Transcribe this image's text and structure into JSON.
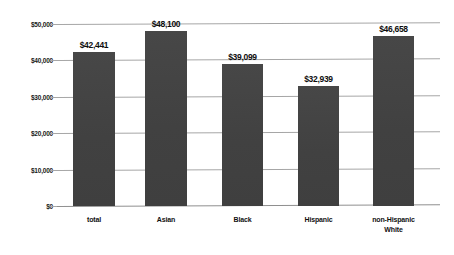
{
  "chart_data": {
    "type": "bar",
    "title": "",
    "subtitle": "",
    "xlabel": "",
    "ylabel": "",
    "categories": [
      "total",
      "Asian",
      "Black",
      "Hispanic",
      "non-Hispanic\nWhite"
    ],
    "values": [
      42441,
      48100,
      39099,
      32939,
      46658
    ],
    "data_labels": [
      "$42,441",
      "$48,100",
      "$39,099",
      "$32,939",
      "$46,658"
    ],
    "ylim": [
      0,
      50000
    ],
    "ytick_values": [
      0,
      10000,
      20000,
      30000,
      40000,
      50000
    ],
    "ytick_labels": [
      "$0",
      "$10,000",
      "$20,000",
      "$30,000",
      "$40,000",
      "$50,000"
    ],
    "grid": true,
    "grid_axis": "y",
    "legend": false,
    "legend_position": "none",
    "series": [
      {
        "name": "",
        "values": [
          42441,
          48100,
          39099,
          32939,
          46658
        ]
      }
    ]
  },
  "style": {
    "bar_color": "#444444",
    "grid_color": "#a6a6a6",
    "text_color": "#111111",
    "background": "#ffffff"
  },
  "axis": {
    "y_labels": [
      {
        "text": "$50,000",
        "value": 50000
      },
      {
        "text": "$40,000",
        "value": 40000
      },
      {
        "text": "$30,000",
        "value": 30000
      },
      {
        "text": "$20,000",
        "value": 20000
      },
      {
        "text": "$10,000",
        "value": 10000
      },
      {
        "text": "$0",
        "value": 0
      }
    ],
    "x_labels": [
      {
        "text": "total"
      },
      {
        "text": "Asian"
      },
      {
        "text": "Black"
      },
      {
        "text": "Hispanic"
      },
      {
        "text": "non-Hispanic\nWhite"
      }
    ]
  },
  "bars": [
    {
      "label": "total",
      "value": 42441,
      "value_label": "$42,441"
    },
    {
      "label": "Asian",
      "value": 48100,
      "value_label": "$48,100"
    },
    {
      "label": "Black",
      "value": 39099,
      "value_label": "$39,099"
    },
    {
      "label": "Hispanic",
      "value": 32939,
      "value_label": "$32,939"
    },
    {
      "label": "non-Hispanic White",
      "value": 46658,
      "value_label": "$46,658"
    }
  ]
}
